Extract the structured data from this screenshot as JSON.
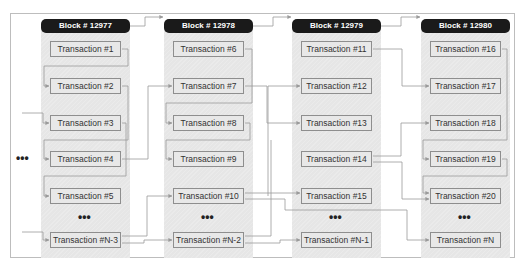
{
  "diagram": {
    "side_ellipsis": "•••",
    "colors": {
      "header_bg": "#1a1a1a",
      "header_text": "#ffffff",
      "panel_bg": "#e6e6e6",
      "line": "#8e8e8e"
    },
    "blocks": [
      {
        "title": "Block # 12977",
        "transactions": [
          "Transaction #1",
          "Transaction #2",
          "Transaction #3",
          "Transaction #4",
          "Transaction #5"
        ],
        "ellipsis": "•••",
        "last": "Transaction #N-3"
      },
      {
        "title": "Block # 12978",
        "transactions": [
          "Transaction #6",
          "Transaction #7",
          "Transaction #8",
          "Transaction #9",
          "Transaction #10"
        ],
        "ellipsis": "•••",
        "last": "Transaction #N-2"
      },
      {
        "title": "Block # 12979",
        "transactions": [
          "Transaction #11",
          "Transaction #12",
          "Transaction #13",
          "Transaction #14",
          "Transaction #15"
        ],
        "ellipsis": "•••",
        "last": "Transaction #N-1"
      },
      {
        "title": "Block # 12980",
        "transactions": [
          "Transaction #16",
          "Transaction #17",
          "Transaction #18",
          "Transaction #19",
          "Transaction #20"
        ],
        "ellipsis": "•••",
        "last": "Transaction #N"
      }
    ]
  }
}
